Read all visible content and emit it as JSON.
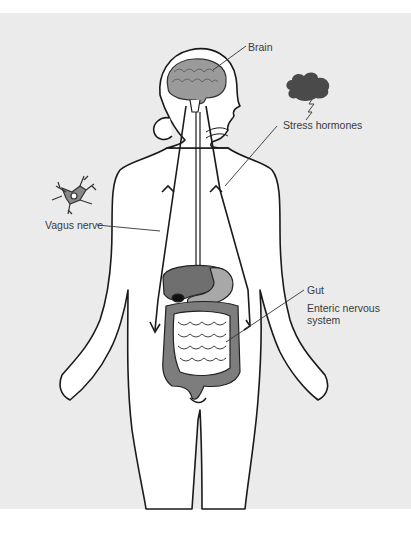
{
  "figure": {
    "colors": {
      "background": "#ebebeb",
      "body_fill": "#ffffff",
      "outline": "#1a1a1a",
      "brain": "#9a9a9a",
      "liver": "#6f6f6f",
      "stomach": "#a8a8a8",
      "colon": "#7d7d7d",
      "small_intestine": "#ffffff",
      "cloud": "#4a4a4a",
      "label_text": "#3a3a3a"
    },
    "labels": {
      "brain": "Brain",
      "stress_hormones": "Stress hormones",
      "vagus_nerve": "Vagus nerve",
      "gut": "Gut",
      "enteric_line1": "Enteric nervous",
      "enteric_line2": "system"
    },
    "icons": {
      "storm_cloud": "storm-cloud-icon",
      "neuron": "neuron-icon"
    }
  }
}
